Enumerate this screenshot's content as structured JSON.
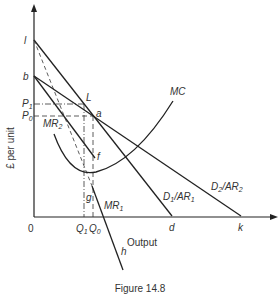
{
  "figure": {
    "caption": "Figure 14.8",
    "ylabel": "£ per unit",
    "xlabel": "Output",
    "origin": "0"
  },
  "points": {
    "l": "l",
    "b": "b",
    "P1": "P",
    "P1_sub": "1",
    "P0": "P",
    "P0_sub": "0",
    "L": "L",
    "a": "a",
    "f": "f",
    "g": "g",
    "h": "h",
    "d": "d",
    "k": "k",
    "Q1": "Q",
    "Q1_sub": "1",
    "Q0": "Q",
    "Q0_sub": "0"
  },
  "curves": {
    "MC": "MC",
    "MR2": "MR",
    "MR2_sub": "2",
    "MR1": "MR",
    "MR1_sub": "1",
    "D1": "D",
    "D1_sub": "1",
    "D1_rest": "/AR",
    "D1_rest_sub": "1",
    "D2": "D",
    "D2_sub": "2",
    "D2_rest": "/AR",
    "D2_rest_sub": "2"
  },
  "colors": {
    "line": "#222222",
    "text": "#333333"
  }
}
